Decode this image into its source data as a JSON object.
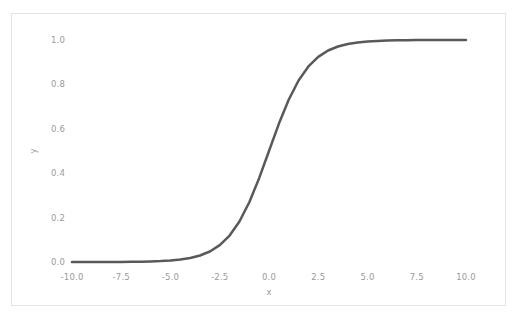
{
  "figure": {
    "background_color": "#ffffff",
    "border_color": "#e3e3e3",
    "tick_label_color": "#9a9a9a",
    "line_color": "#595959"
  },
  "chart_data": {
    "type": "line",
    "title": "",
    "xlabel": "x",
    "ylabel": "y",
    "xlim": [
      -10.0,
      10.0
    ],
    "ylim": [
      -0.05,
      1.05
    ],
    "grid": false,
    "legend": null,
    "xticks": [
      "-10.0",
      "-7.5",
      "-5.0",
      "-2.5",
      "0.0",
      "2.5",
      "5.0",
      "7.5",
      "10.0"
    ],
    "xtick_values": [
      -10.0,
      -7.5,
      -5.0,
      -2.5,
      0.0,
      2.5,
      5.0,
      7.5,
      10.0
    ],
    "yticks": [
      "0.0",
      "0.2",
      "0.4",
      "0.6",
      "0.8",
      "1.0"
    ],
    "ytick_values": [
      0.0,
      0.2,
      0.4,
      0.6,
      0.8,
      1.0
    ],
    "series": [
      {
        "name": "sigmoid",
        "color": "#595959",
        "linewidth": 2.5,
        "x": [
          -10.0,
          -9.5,
          -9.0,
          -8.5,
          -8.0,
          -7.5,
          -7.0,
          -6.5,
          -6.0,
          -5.5,
          -5.0,
          -4.5,
          -4.0,
          -3.5,
          -3.0,
          -2.5,
          -2.0,
          -1.5,
          -1.0,
          -0.5,
          0.0,
          0.5,
          1.0,
          1.5,
          2.0,
          2.5,
          3.0,
          3.5,
          4.0,
          4.5,
          5.0,
          5.5,
          6.0,
          6.5,
          7.0,
          7.5,
          8.0,
          8.5,
          9.0,
          9.5,
          10.0
        ],
        "y": [
          4.54e-05,
          7.49e-05,
          0.0001234,
          0.0002035,
          0.0003354,
          0.0005527,
          0.0009111,
          0.0015012,
          0.0024726,
          0.00407,
          0.0066929,
          0.0109869,
          0.0179862,
          0.0293122,
          0.0474259,
          0.0758582,
          0.1192029,
          0.1824255,
          0.2689414,
          0.3775407,
          0.5,
          0.6224593,
          0.7310586,
          0.8175745,
          0.8807971,
          0.9241418,
          0.9525741,
          0.9706878,
          0.9820138,
          0.9890131,
          0.9933071,
          0.99593,
          0.9975274,
          0.9984988,
          0.9990889,
          0.9994473,
          0.9996646,
          0.9997965,
          0.9998766,
          0.9999251,
          0.9999546
        ]
      }
    ]
  }
}
